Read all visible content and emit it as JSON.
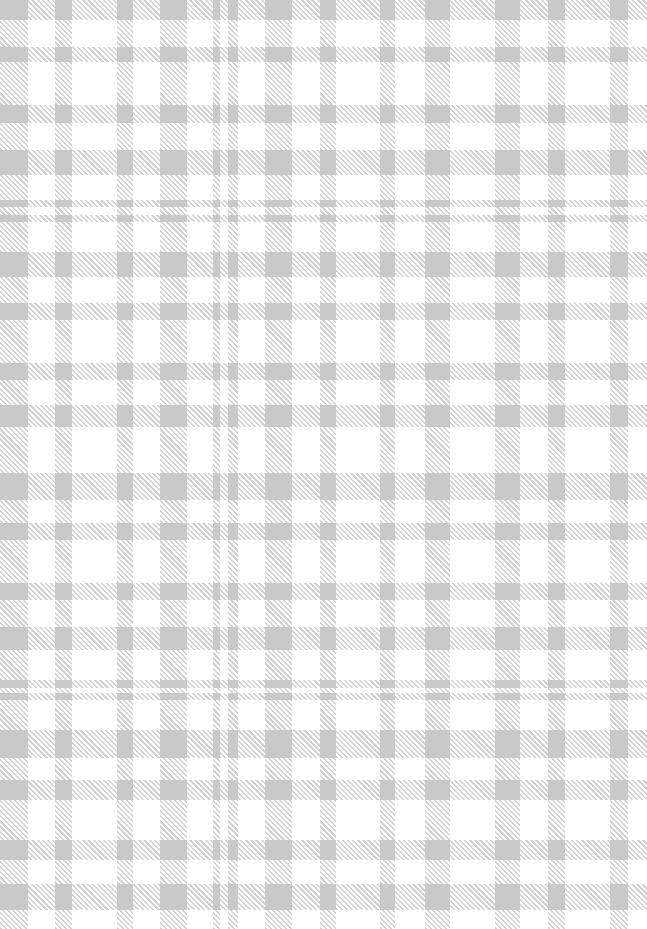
{
  "image": {
    "description": "Gray and white plaid (tartan/gingham) textile pattern with diagonal hatched stripes and solid gray intersections",
    "width": 647,
    "height": 929,
    "colors": {
      "background": "#ffffff",
      "hatch": "#d2d2d2",
      "intersection": "#c9c9c9"
    },
    "vertical_stripes": [
      [
        0,
        28
      ],
      [
        55,
        72
      ],
      [
        117,
        133
      ],
      [
        160,
        187
      ],
      [
        213,
        220
      ],
      [
        228,
        238
      ],
      [
        265,
        292
      ],
      [
        320,
        336
      ],
      [
        380,
        395
      ],
      [
        425,
        450
      ],
      [
        495,
        520
      ],
      [
        548,
        565
      ],
      [
        610,
        628
      ]
    ],
    "horizontal_stripes": [
      [
        0,
        20
      ],
      [
        47,
        62
      ],
      [
        105,
        123
      ],
      [
        150,
        175
      ],
      [
        200,
        207
      ],
      [
        215,
        222
      ],
      [
        252,
        277
      ],
      [
        303,
        320
      ],
      [
        363,
        380
      ],
      [
        405,
        427
      ],
      [
        473,
        500
      ],
      [
        523,
        540
      ],
      [
        583,
        600
      ],
      [
        627,
        650
      ],
      [
        680,
        688
      ],
      [
        693,
        700
      ],
      [
        730,
        758
      ],
      [
        780,
        800
      ],
      [
        840,
        860
      ],
      [
        884,
        910
      ]
    ]
  }
}
